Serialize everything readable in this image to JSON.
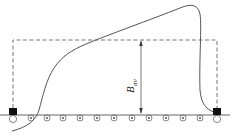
{
  "diagram": {
    "label": "B",
    "label_subscript": "av",
    "colors": {
      "line": "#555555",
      "dash": "#666666",
      "square": "#111111",
      "background": "#ffffff"
    },
    "conductors": {
      "count": 13,
      "end_conductors": "plain-circle",
      "inner_conductors": "dot-circle"
    }
  }
}
